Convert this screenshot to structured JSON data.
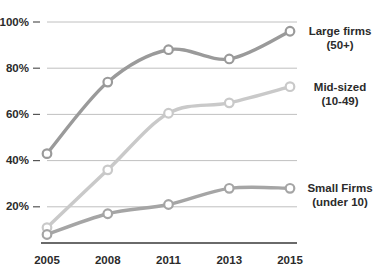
{
  "chart_data": {
    "type": "line",
    "title": "",
    "subtitle": "",
    "xlabel": "",
    "ylabel": "",
    "categories": [
      "2005",
      "2008",
      "2011",
      "2013",
      "2015"
    ],
    "ylim": [
      0,
      100
    ],
    "y_ticks": [
      "20%",
      "40%",
      "60%",
      "80%",
      "100%"
    ],
    "y_tick_values": [
      20,
      40,
      60,
      80,
      100
    ],
    "grid": true,
    "legend_position": "right-inline",
    "series": [
      {
        "name": "Large firms",
        "sublabel": "(50+)",
        "label_line1": "Large firms",
        "label_line2": "(50+)",
        "color": "#9a9a9a",
        "values": [
          43,
          74,
          88,
          84,
          96
        ]
      },
      {
        "name": "Mid-sized",
        "sublabel": "(10-49)",
        "label_line1": "Mid-sized",
        "label_line2": "(10-49)",
        "color": "#c9c9c9",
        "values": [
          11,
          36,
          60.5,
          65,
          72
        ]
      },
      {
        "name": "Small Firms",
        "sublabel": "(under 10)",
        "label_line1": "Small Firms",
        "label_line2": "(under 10)",
        "color": "#a5a5a5",
        "values": [
          8,
          17,
          21,
          28,
          28
        ]
      }
    ]
  },
  "colors": {
    "background": "#ffffff",
    "gridline": "#b9b9b9",
    "axis": "#6a6a6a",
    "text": "#2b2b2b",
    "marker_fill": "#ffffff"
  }
}
